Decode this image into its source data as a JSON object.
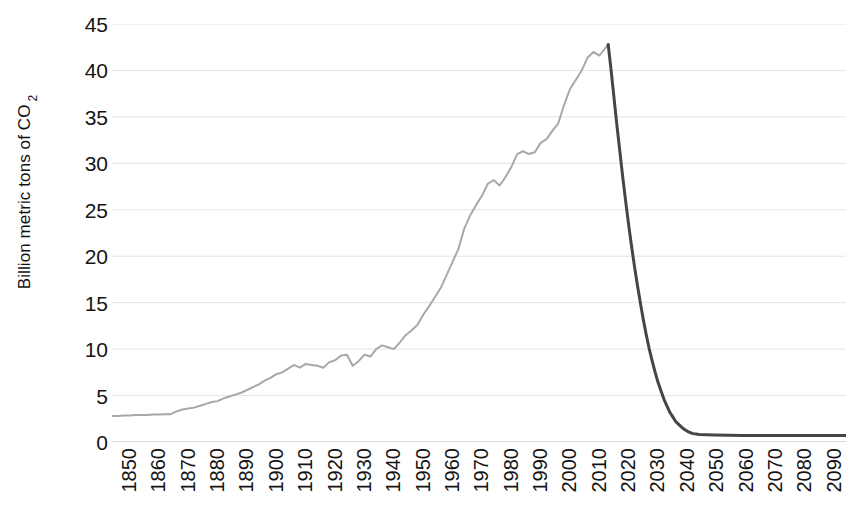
{
  "chart_data": {
    "type": "line",
    "title": "",
    "subtitle": "",
    "xlabel": "",
    "ylabel": "Billion metric tons of CO",
    "ylabel_subscript": "2",
    "xlim": [
      1850,
      2100
    ],
    "ylim": [
      0,
      45
    ],
    "grid": true,
    "grid_axis": "y",
    "legend": "none",
    "y_ticks": [
      0,
      5,
      10,
      15,
      20,
      25,
      30,
      35,
      40,
      45
    ],
    "y_tick_labels": [
      "0",
      "5",
      "10",
      "15",
      "20",
      "25",
      "30",
      "35",
      "40",
      "45"
    ],
    "x_ticks": [
      1850,
      1860,
      1870,
      1880,
      1890,
      1900,
      1910,
      1920,
      1930,
      1940,
      1950,
      1960,
      1970,
      1980,
      1990,
      2000,
      2010,
      2020,
      2030,
      2040,
      2050,
      2060,
      2070,
      2080,
      2090
    ],
    "x_tick_labels": [
      "1850",
      "1860",
      "1870",
      "1880",
      "1890",
      "1900",
      "1910",
      "1920",
      "1930",
      "1940",
      "1950",
      "1960",
      "1970",
      "1980",
      "1990",
      "2000",
      "2010",
      "2020",
      "2030",
      "2040",
      "2050",
      "2060",
      "2070",
      "2080",
      "2090"
    ],
    "colors": {
      "historical_line": "#a8a8a8",
      "projection_line": "#454545",
      "gridline": "#e4e4e4",
      "zero_line": "#cfcfcf",
      "text": "#141414",
      "background": "#ffffff"
    },
    "series": [
      {
        "name": "Historical emissions",
        "color": "#a8a8a8",
        "line_width": 2,
        "x": [
          1850,
          1852,
          1854,
          1856,
          1858,
          1860,
          1862,
          1864,
          1866,
          1868,
          1870,
          1872,
          1874,
          1876,
          1878,
          1880,
          1882,
          1884,
          1886,
          1888,
          1890,
          1892,
          1894,
          1896,
          1898,
          1900,
          1902,
          1904,
          1906,
          1908,
          1910,
          1912,
          1914,
          1916,
          1918,
          1920,
          1922,
          1924,
          1926,
          1928,
          1930,
          1932,
          1934,
          1936,
          1938,
          1940,
          1942,
          1944,
          1946,
          1948,
          1950,
          1952,
          1954,
          1956,
          1958,
          1960,
          1962,
          1964,
          1966,
          1968,
          1970,
          1972,
          1974,
          1976,
          1978,
          1980,
          1982,
          1984,
          1986,
          1988,
          1990,
          1992,
          1994,
          1996,
          1998,
          2000,
          2002,
          2004,
          2006,
          2008,
          2010,
          2012,
          2014,
          2016,
          2018,
          2019
        ],
        "y": [
          2.8,
          2.8,
          2.85,
          2.85,
          2.9,
          2.9,
          2.9,
          2.95,
          2.95,
          3.0,
          3.0,
          3.3,
          3.5,
          3.6,
          3.7,
          3.9,
          4.1,
          4.3,
          4.4,
          4.7,
          4.9,
          5.1,
          5.3,
          5.6,
          5.9,
          6.2,
          6.6,
          6.9,
          7.3,
          7.5,
          7.9,
          8.3,
          8.0,
          8.4,
          8.3,
          8.2,
          8.0,
          8.6,
          8.8,
          9.3,
          9.4,
          8.2,
          8.7,
          9.4,
          9.2,
          10.0,
          10.4,
          10.2,
          10.0,
          10.7,
          11.5,
          12.0,
          12.6,
          13.7,
          14.6,
          15.6,
          16.6,
          18.0,
          19.4,
          20.8,
          23.0,
          24.4,
          25.5,
          26.5,
          27.8,
          28.2,
          27.6,
          28.5,
          29.6,
          31.0,
          31.3,
          31.0,
          31.2,
          32.2,
          32.6,
          33.5,
          34.3,
          36.3,
          38.0,
          39.0,
          40.0,
          41.4,
          42.0,
          41.6,
          42.4,
          42.8
        ]
      },
      {
        "name": "Projected rapid decarbonization pathway",
        "color": "#454545",
        "line_width": 3,
        "x": [
          2019,
          2020,
          2021,
          2022,
          2023,
          2024,
          2025,
          2026,
          2027,
          2028,
          2029,
          2030,
          2031,
          2032,
          2033,
          2034,
          2035,
          2036,
          2037,
          2038,
          2039,
          2040,
          2041,
          2042,
          2043,
          2044,
          2045,
          2046,
          2047,
          2048,
          2049,
          2050,
          2055,
          2060,
          2065,
          2070,
          2075,
          2080,
          2085,
          2090,
          2095,
          2100
        ],
        "y": [
          42.8,
          40.0,
          37.0,
          34.0,
          31.2,
          28.4,
          25.8,
          23.3,
          21.0,
          18.8,
          16.8,
          14.9,
          13.1,
          11.5,
          10.0,
          8.7,
          7.5,
          6.4,
          5.5,
          4.6,
          3.9,
          3.2,
          2.7,
          2.2,
          1.9,
          1.6,
          1.35,
          1.15,
          1.0,
          0.9,
          0.85,
          0.8,
          0.75,
          0.72,
          0.7,
          0.7,
          0.7,
          0.7,
          0.7,
          0.7,
          0.7,
          0.7
        ]
      }
    ],
    "annotations": [
      {
        "label": "peak emissions",
        "x": 2019,
        "y": 42.8
      },
      {
        "label": "near-zero plateau",
        "x": 2060,
        "y": 0.7
      }
    ]
  }
}
